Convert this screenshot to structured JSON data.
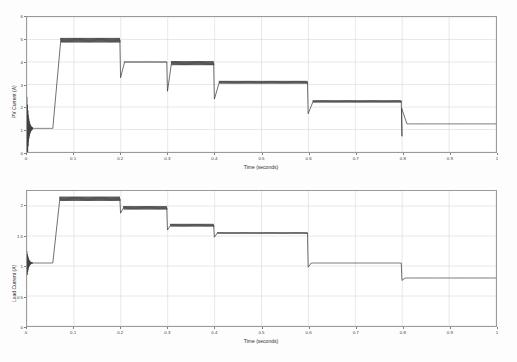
{
  "figure": {
    "background_color": "#fdfdfd",
    "axes_background": "#ffffff",
    "grid_color": "#d9d9d9",
    "line_color": "#404040",
    "frame_color": "#9a9a9a",
    "grid": true,
    "panels": 2
  },
  "chart_data": [
    {
      "type": "line",
      "title": "",
      "subtitle": "",
      "xlabel": "Time (seconds)",
      "ylabel": "PV Current (A)",
      "xlim": [
        0,
        1
      ],
      "ylim": [
        0,
        6
      ],
      "xticks": [
        0,
        0.1,
        0.2,
        0.3,
        0.4,
        0.5,
        0.6,
        0.7,
        0.8,
        0.9,
        1
      ],
      "xticklabels": [
        "0",
        "0.1",
        "0.2",
        "0.3",
        "0.4",
        "0.5",
        "0.6",
        "0.7",
        "0.8",
        "0.9",
        "1"
      ],
      "yticks": [
        0,
        1,
        2,
        3,
        4,
        5,
        6
      ],
      "yticklabels": [
        "0",
        "1",
        "2",
        "3",
        "4",
        "5",
        "6"
      ],
      "grid": true,
      "legend": null,
      "legend_position": "none",
      "series": [
        {
          "name": "PV Current",
          "ripple": true,
          "x": [
            0,
            0.002,
            0.006,
            0.01,
            0.02,
            0.03,
            0.055,
            0.057,
            0.062,
            0.07,
            0.08,
            0.1,
            0.15,
            0.198,
            0.2,
            0.202,
            0.205,
            0.21,
            0.25,
            0.298,
            0.3,
            0.302,
            0.305,
            0.31,
            0.35,
            0.398,
            0.4,
            0.402,
            0.406,
            0.41,
            0.45,
            0.5,
            0.55,
            0.598,
            0.6,
            0.602,
            0.606,
            0.61,
            0.65,
            0.7,
            0.75,
            0.798,
            0.8,
            0.802,
            0.806,
            0.81,
            0.85,
            0.9,
            0.95,
            1.0
          ],
          "y": [
            0.0,
            2.4,
            0.3,
            1.65,
            0.95,
            1.05,
            1.05,
            1.1,
            3.2,
            4.85,
            4.95,
            4.97,
            4.97,
            4.97,
            4.97,
            3.35,
            3.75,
            4.0,
            4.0,
            4.0,
            2.75,
            3.62,
            3.9,
            3.95,
            3.95,
            3.95,
            2.4,
            2.95,
            3.1,
            3.1,
            3.1,
            3.1,
            3.1,
            3.1,
            1.75,
            2.2,
            2.25,
            2.25,
            2.25,
            2.25,
            2.25,
            2.25,
            0.75,
            1.25,
            1.25,
            1.25,
            1.25,
            1.25,
            1.25,
            1.25
          ],
          "plateaus": [
            {
              "t_start": 0.01,
              "t_end": 0.055,
              "value": 1.05,
              "ripple_amp": 0.0
            },
            {
              "t_start": 0.072,
              "t_end": 0.198,
              "value": 4.97,
              "ripple_amp": 0.1
            },
            {
              "t_start": 0.208,
              "t_end": 0.298,
              "value": 4.0,
              "ripple_amp": 0.02
            },
            {
              "t_start": 0.308,
              "t_end": 0.398,
              "value": 3.95,
              "ripple_amp": 0.09
            },
            {
              "t_start": 0.41,
              "t_end": 0.598,
              "value": 3.1,
              "ripple_amp": 0.06
            },
            {
              "t_start": 0.61,
              "t_end": 0.798,
              "value": 2.25,
              "ripple_amp": 0.05
            },
            {
              "t_start": 0.81,
              "t_end": 1.0,
              "value": 1.25,
              "ripple_amp": 0.0
            }
          ],
          "transients": [
            {
              "t": 0.0,
              "peak_high": 2.45,
              "peak_low": 0.0,
              "note": "startup oscillation"
            },
            {
              "t": 0.2,
              "dip_to": 3.3
            },
            {
              "t": 0.3,
              "dip_to": 2.7
            },
            {
              "t": 0.4,
              "dip_to": 2.35
            },
            {
              "t": 0.6,
              "dip_to": 1.7
            },
            {
              "t": 0.8,
              "spike_to": 1.95,
              "dip_to": 0.7
            }
          ]
        }
      ]
    },
    {
      "type": "line",
      "title": "",
      "subtitle": "",
      "xlabel": "Time (seconds)",
      "ylabel": "Load Current (A)",
      "xlim": [
        0,
        1
      ],
      "ylim": [
        0,
        2.25
      ],
      "xticks": [
        0,
        0.1,
        0.2,
        0.3,
        0.4,
        0.5,
        0.6,
        0.7,
        0.8,
        0.9,
        1
      ],
      "xticklabels": [
        "0",
        "0.1",
        "0.2",
        "0.3",
        "0.4",
        "0.5",
        "0.6",
        "0.7",
        "0.8",
        "0.9",
        "1"
      ],
      "yticks": [
        0,
        0.5,
        1,
        1.5,
        2
      ],
      "yticklabels": [
        "0",
        "0.5",
        "1",
        "1.5",
        "2"
      ],
      "grid": true,
      "legend": null,
      "legend_position": "none",
      "series": [
        {
          "name": "Load Current",
          "ripple": true,
          "x": [
            0,
            0.003,
            0.008,
            0.014,
            0.02,
            0.03,
            0.055,
            0.058,
            0.065,
            0.075,
            0.09,
            0.12,
            0.16,
            0.198,
            0.2,
            0.203,
            0.208,
            0.24,
            0.28,
            0.298,
            0.3,
            0.303,
            0.31,
            0.34,
            0.38,
            0.398,
            0.4,
            0.403,
            0.41,
            0.45,
            0.5,
            0.55,
            0.598,
            0.6,
            0.603,
            0.61,
            0.65,
            0.7,
            0.75,
            0.798,
            0.8,
            0.803,
            0.81,
            0.85,
            0.9,
            0.95,
            1.0
          ],
          "y": [
            1.05,
            1.22,
            0.9,
            1.1,
            1.0,
            1.05,
            1.05,
            1.1,
            1.9,
            2.1,
            2.12,
            2.12,
            2.12,
            2.12,
            2.12,
            1.9,
            1.97,
            1.97,
            1.97,
            1.97,
            1.62,
            1.66,
            1.68,
            1.68,
            1.68,
            1.68,
            1.5,
            1.54,
            1.55,
            1.55,
            1.55,
            1.55,
            1.55,
            1.0,
            1.04,
            1.05,
            1.05,
            1.05,
            1.05,
            1.05,
            0.78,
            0.8,
            0.8,
            0.8,
            0.8,
            0.8,
            0.8
          ],
          "plateaus": [
            {
              "t_start": 0.012,
              "t_end": 0.055,
              "value": 1.05,
              "ripple_amp": 0.0
            },
            {
              "t_start": 0.07,
              "t_end": 0.198,
              "value": 2.12,
              "ripple_amp": 0.035
            },
            {
              "t_start": 0.206,
              "t_end": 0.298,
              "value": 1.97,
              "ripple_amp": 0.028
            },
            {
              "t_start": 0.306,
              "t_end": 0.398,
              "value": 1.68,
              "ripple_amp": 0.022
            },
            {
              "t_start": 0.406,
              "t_end": 0.598,
              "value": 1.55,
              "ripple_amp": 0.012
            },
            {
              "t_start": 0.606,
              "t_end": 0.798,
              "value": 1.05,
              "ripple_amp": 0.0
            },
            {
              "t_start": 0.806,
              "t_end": 1.0,
              "value": 0.8,
              "ripple_amp": 0.0
            }
          ],
          "transients": [
            {
              "t": 0.0,
              "peak_high": 1.25,
              "peak_low": 0.85,
              "note": "startup oscillation"
            },
            {
              "t": 0.2,
              "dip_to": 1.88
            },
            {
              "t": 0.3,
              "dip_to": 1.6
            },
            {
              "t": 0.4,
              "dip_to": 1.48
            },
            {
              "t": 0.6,
              "dip_to": 0.98
            },
            {
              "t": 0.8,
              "dip_to": 0.76
            }
          ]
        }
      ]
    }
  ]
}
